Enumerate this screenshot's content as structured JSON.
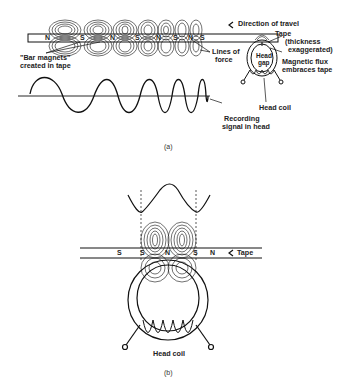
{
  "figure_a": {
    "caption": "(a)",
    "labels": {
      "direction": "Direction of travel",
      "tape": "Tape",
      "thickness_1": "(thickness",
      "thickness_2": "exaggerated)",
      "bar_magnets_1": "\"Bar magnets\"",
      "bar_magnets_2": "created in tape",
      "lines_of_force_1": "Lines of",
      "lines_of_force_2": "force",
      "head_gap_1": "Head",
      "head_gap_2": "gap",
      "magnetic_flux_1": "Magnetic flux",
      "magnetic_flux_2": "embraces tape",
      "head_coil": "Head coil",
      "recording_signal_1": "Recording",
      "recording_signal_2": "signal in head"
    },
    "poles": [
      "N",
      "S",
      "N",
      "S",
      "N",
      "S",
      "N",
      "S"
    ]
  },
  "figure_b": {
    "caption": "(b)",
    "labels": {
      "tape": "Tape",
      "head_coil": "Head coil"
    },
    "poles": [
      "S",
      "S",
      "N",
      "S",
      "N"
    ]
  },
  "icons": {
    "direction_arrow": "arrow-left-icon"
  }
}
